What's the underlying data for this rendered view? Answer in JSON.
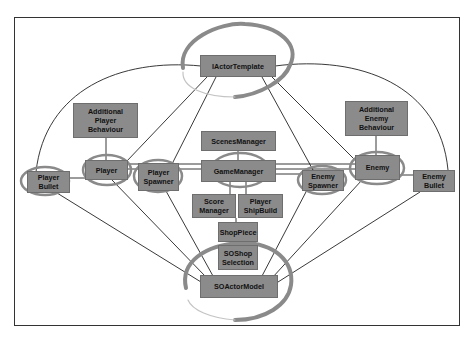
{
  "diagram": {
    "type": "architecture-relationship-diagram",
    "colors": {
      "node_fill": "#8b8b8b",
      "node_border": "#6e6e6e",
      "node_text": "#111111",
      "edge": "#222222",
      "highlight_ring": "#8a8a8a",
      "frame": "#333333"
    },
    "nodes": [
      {
        "id": "iactortemplate",
        "label": "IActorTemplate",
        "highlighted": true
      },
      {
        "id": "additional-player-behaviour",
        "label": "Additional\nPlayer\nBehaviour",
        "highlighted": false
      },
      {
        "id": "additional-enemy-behaviour",
        "label": "Additional\nEnemy\nBehaviour",
        "highlighted": true
      },
      {
        "id": "scenesmanager",
        "label": "ScenesManager",
        "highlighted": false
      },
      {
        "id": "player",
        "label": "Player",
        "highlighted": true
      },
      {
        "id": "player-bullet",
        "label": "Player\nBullet",
        "highlighted": true
      },
      {
        "id": "player-spawner",
        "label": "Player\nSpawner",
        "highlighted": true
      },
      {
        "id": "gamemanager",
        "label": "GameManager",
        "highlighted": true
      },
      {
        "id": "enemy-spawner",
        "label": "Enemy\nSpawner",
        "highlighted": true
      },
      {
        "id": "enemy",
        "label": "Enemy",
        "highlighted": true
      },
      {
        "id": "enemy-bullet",
        "label": "Enemy\nBullet",
        "highlighted": false
      },
      {
        "id": "score-manager",
        "label": "Score\nManager",
        "highlighted": false
      },
      {
        "id": "player-shipbuild",
        "label": "Player\nShipBuild",
        "highlighted": false
      },
      {
        "id": "shoppiece",
        "label": "ShopPiece",
        "highlighted": false
      },
      {
        "id": "soshop-selection",
        "label": "SOShop\nSelection",
        "highlighted": false
      },
      {
        "id": "soactormodel",
        "label": "SOActorModel",
        "highlighted": true
      }
    ],
    "edges": [
      [
        "iactortemplate",
        "player-bullet"
      ],
      [
        "iactortemplate",
        "enemy-bullet"
      ],
      [
        "iactortemplate",
        "player"
      ],
      [
        "iactortemplate",
        "player-spawner"
      ],
      [
        "iactortemplate",
        "enemy-spawner"
      ],
      [
        "iactortemplate",
        "enemy"
      ],
      [
        "additional-player-behaviour",
        "player"
      ],
      [
        "additional-enemy-behaviour",
        "enemy"
      ],
      [
        "player-bullet",
        "player"
      ],
      [
        "player",
        "enemy"
      ],
      [
        "player-spawner",
        "gamemanager"
      ],
      [
        "gamemanager",
        "enemy-spawner"
      ],
      [
        "enemy",
        "enemy-bullet"
      ],
      [
        "scenesmanager",
        "gamemanager"
      ],
      [
        "gamemanager",
        "score-manager"
      ],
      [
        "gamemanager",
        "player-shipbuild"
      ],
      [
        "score-manager",
        "shoppiece"
      ],
      [
        "shoppiece",
        "soshop-selection"
      ],
      [
        "player-bullet",
        "soactormodel"
      ],
      [
        "player",
        "soactormodel"
      ],
      [
        "player-spawner",
        "soactormodel"
      ],
      [
        "enemy-spawner",
        "soactormodel"
      ],
      [
        "enemy",
        "soactormodel"
      ],
      [
        "enemy-bullet",
        "soactormodel"
      ]
    ]
  }
}
